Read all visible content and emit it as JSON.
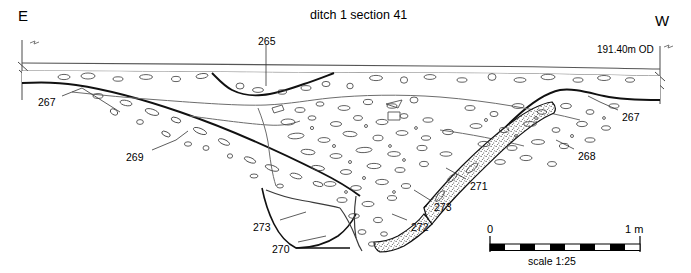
{
  "figure": {
    "title": "ditch 1 section 41",
    "orientation_left": "E",
    "orientation_right": "W",
    "datum_label": "191.40m OD"
  },
  "context_labels": [
    {
      "id": "265",
      "text": "265",
      "x": 258,
      "y": 36
    },
    {
      "id": "267-left",
      "text": "267",
      "x": 38,
      "y": 97
    },
    {
      "id": "267-right",
      "text": "267",
      "x": 622,
      "y": 112
    },
    {
      "id": "268",
      "text": "268",
      "x": 578,
      "y": 151
    },
    {
      "id": "269",
      "text": "269",
      "x": 126,
      "y": 152
    },
    {
      "id": "270",
      "text": "270",
      "x": 272,
      "y": 244
    },
    {
      "id": "271",
      "text": "271",
      "x": 470,
      "y": 181
    },
    {
      "id": "272",
      "text": "272",
      "x": 411,
      "y": 222
    },
    {
      "id": "273-lower",
      "text": "273",
      "x": 253,
      "y": 222
    },
    {
      "id": "273-upper",
      "text": "273",
      "x": 434,
      "y": 202
    }
  ],
  "scale_bar": {
    "start_label": "0",
    "end_label": "1 m",
    "caption": "scale 1:25",
    "segments": 10,
    "fill_color": "#000000",
    "x": 490,
    "y": 240,
    "width": 150
  },
  "chart_data": {
    "type": "line",
    "title": "ditch 1 section 41",
    "subtitle": "archaeological section drawing",
    "xlabel": "",
    "ylabel": ""
  }
}
